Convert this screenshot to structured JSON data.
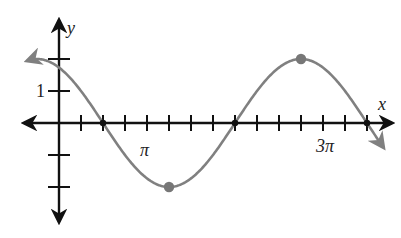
{
  "chart_data": {
    "type": "line",
    "title": "",
    "xlabel": "x",
    "ylabel": "y",
    "function": "y = 2cos(2x/3 + π/6)",
    "x_tick_step": "π/4",
    "x_tick_labels": [
      {
        "value": "π",
        "label": "π"
      },
      {
        "value": "3π",
        "label": "3π"
      }
    ],
    "y_tick_labels": [
      {
        "value": 1,
        "label": "1"
      }
    ],
    "y_ticks": [
      2,
      1,
      -1,
      -2
    ],
    "xlim_ticks": [
      -1,
      15
    ],
    "ylim": [
      -2.5,
      2.5
    ],
    "grid": false,
    "legend": null,
    "zeros": [
      "π/2",
      "2π",
      "7π/2"
    ],
    "marked_points": [
      {
        "x": "π/2",
        "y": 0,
        "kind": "zero"
      },
      {
        "x": "5π/4",
        "y": -2,
        "kind": "minimum"
      },
      {
        "x": "2π",
        "y": 0,
        "kind": "zero"
      },
      {
        "x": "11π/4",
        "y": 2,
        "kind": "maximum"
      },
      {
        "x": "7π/2",
        "y": 0,
        "kind": "zero"
      }
    ],
    "series": [
      {
        "name": "y = 2cos(2x/3 + π/6)",
        "color": "#808080",
        "x_in_quarter_pi": [
          -1,
          0,
          1,
          2,
          3,
          4,
          5,
          6,
          7,
          8,
          9,
          10,
          11,
          12,
          13,
          14,
          15
        ],
        "values": [
          2.0,
          1.73,
          1.0,
          0.0,
          -1.0,
          -1.73,
          -2.0,
          -1.73,
          -1.0,
          0.0,
          1.0,
          1.73,
          2.0,
          1.73,
          1.0,
          0.0,
          -1.0
        ]
      }
    ]
  },
  "labels": {
    "x_axis": "x",
    "y_axis": "y",
    "y_one": "1",
    "pi": "π",
    "three_pi": "3π"
  },
  "colors": {
    "axis": "#111111",
    "curve": "#808080",
    "point": "#777777"
  }
}
